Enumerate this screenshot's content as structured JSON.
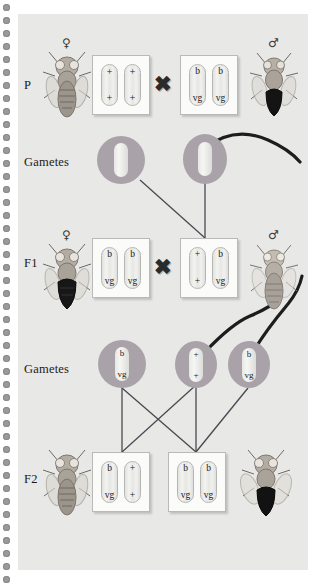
{
  "figure": {
    "organism": "drosophila-melanogaster",
    "row_labels": [
      "P",
      "Gametes",
      "F1",
      "Gametes",
      "F2"
    ],
    "cross_symbol": "✖",
    "female_symbol": "♀",
    "male_symbol": "♂",
    "alleles": {
      "wild_type": "+",
      "black": "b",
      "vestigial": "vg"
    },
    "colors": {
      "panel_background": "#e8e8e6",
      "gamete_fill": "#a9a2a8",
      "chromosome_fill": "#eeeeec",
      "line": "#4a4a52",
      "text": "#1b1b1b",
      "binding_dot": "#9a9a9a"
    }
  },
  "rows": {
    "p": {
      "label": "P",
      "female_symbol": "♀",
      "male_symbol": "♂",
      "female_box": {
        "chromosomes": [
          {
            "top": "+",
            "bottom": "+"
          },
          {
            "top": "+",
            "bottom": "+"
          }
        ]
      },
      "male_box": {
        "chromosomes": [
          {
            "top": "b",
            "bottom": "vg"
          },
          {
            "top": "b",
            "bottom": "vg"
          }
        ]
      },
      "cross": "✖"
    },
    "gametes_p": {
      "label": "Gametes",
      "cells": [
        {
          "type": "egg",
          "chromosome": {
            "top": "",
            "bottom": ""
          }
        },
        {
          "type": "sperm",
          "chromosome": {
            "top": "",
            "bottom": ""
          }
        }
      ]
    },
    "f1": {
      "label": "F1",
      "female_symbol": "♀",
      "male_symbol": "♂",
      "female_box": {
        "chromosomes": [
          {
            "top": "b",
            "bottom": "vg"
          },
          {
            "top": "b",
            "bottom": "vg"
          }
        ]
      },
      "male_box": {
        "chromosomes": [
          {
            "top": "+",
            "bottom": "+"
          },
          {
            "top": "b",
            "bottom": "vg"
          }
        ]
      },
      "cross": "✖"
    },
    "gametes_f1": {
      "label": "Gametes",
      "cells": [
        {
          "type": "egg",
          "chromosome": {
            "top": "b",
            "bottom": "vg"
          }
        },
        {
          "type": "sperm",
          "chromosome": {
            "top": "+",
            "bottom": "+"
          }
        },
        {
          "type": "sperm",
          "chromosome": {
            "top": "b",
            "bottom": "vg"
          }
        }
      ]
    },
    "f2": {
      "label": "F2",
      "left_box": {
        "chromosomes": [
          {
            "top": "b",
            "bottom": "vg"
          },
          {
            "top": "+",
            "bottom": "+"
          }
        ]
      },
      "right_box": {
        "chromosomes": [
          {
            "top": "b",
            "bottom": "vg"
          },
          {
            "top": "b",
            "bottom": "vg"
          }
        ]
      }
    }
  }
}
